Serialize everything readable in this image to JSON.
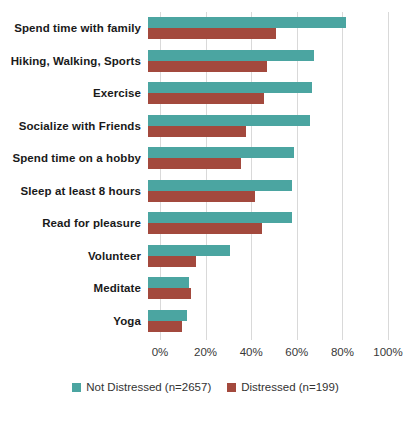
{
  "chart_data": {
    "type": "bar",
    "orientation": "horizontal",
    "title": "",
    "xlabel": "",
    "ylabel": "",
    "categories": [
      "Spend time with family",
      "Hiking, Walking, Sports",
      "Exercise",
      "Socialize with Friends",
      "Spend time on a hobby",
      "Sleep at least 8 hours",
      "Read for pleasure",
      "Volunteer",
      "Meditate",
      "Yoga"
    ],
    "series": [
      {
        "name": "Not Distressed (n=2657)",
        "color": "#4ba5a1",
        "values": [
          87,
          73,
          72,
          71,
          64,
          63,
          63,
          36,
          18,
          17
        ]
      },
      {
        "name": "Distressed (n=199)",
        "color": "#a3493d",
        "values": [
          56,
          52,
          51,
          43,
          41,
          47,
          50,
          21,
          19,
          15
        ]
      }
    ],
    "xlim": [
      0,
      100
    ],
    "xticks": [
      0,
      20,
      40,
      60,
      80,
      100
    ],
    "xtick_labels": [
      "0%",
      "20%",
      "40%",
      "60%",
      "80%",
      "100%"
    ],
    "grid": "vertical",
    "gridline_color": "#d9d9d9",
    "legend_position": "bottom"
  }
}
